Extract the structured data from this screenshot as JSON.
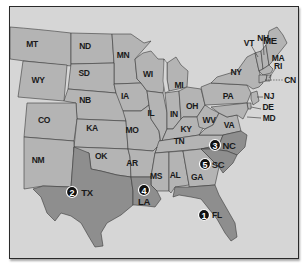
{
  "map": {
    "title": "",
    "background_color": "#d6d6d6",
    "state_fill": "#b4b4b4",
    "highlight_fill": "#8e8e8e",
    "badge_color": "#111111",
    "states": [
      {
        "code": "MT",
        "label": "MT",
        "highlighted": false
      },
      {
        "code": "ND",
        "label": "ND",
        "highlighted": false
      },
      {
        "code": "MN",
        "label": "MN",
        "highlighted": false
      },
      {
        "code": "WY",
        "label": "WY",
        "highlighted": false
      },
      {
        "code": "SD",
        "label": "SD",
        "highlighted": false
      },
      {
        "code": "WI",
        "label": "WI",
        "highlighted": false
      },
      {
        "code": "MI",
        "label": "MI",
        "highlighted": false
      },
      {
        "code": "NB",
        "label": "NB",
        "highlighted": false
      },
      {
        "code": "IA",
        "label": "IA",
        "highlighted": false
      },
      {
        "code": "CO",
        "label": "CO",
        "highlighted": false
      },
      {
        "code": "KA",
        "label": "KA",
        "highlighted": false
      },
      {
        "code": "MO",
        "label": "MO",
        "highlighted": false
      },
      {
        "code": "IL",
        "label": "IL",
        "highlighted": false
      },
      {
        "code": "IN",
        "label": "IN",
        "highlighted": false
      },
      {
        "code": "OH",
        "label": "OH",
        "highlighted": false
      },
      {
        "code": "KY",
        "label": "KY",
        "highlighted": false
      },
      {
        "code": "WV",
        "label": "WV",
        "highlighted": false
      },
      {
        "code": "VA",
        "label": "VA",
        "highlighted": false
      },
      {
        "code": "PA",
        "label": "PA",
        "highlighted": false
      },
      {
        "code": "NY",
        "label": "NY",
        "highlighted": false
      },
      {
        "code": "VT",
        "label": "VT",
        "highlighted": false
      },
      {
        "code": "NH",
        "label": "NH",
        "highlighted": false
      },
      {
        "code": "ME",
        "label": "ME",
        "highlighted": false
      },
      {
        "code": "MA",
        "label": "MA",
        "highlighted": false
      },
      {
        "code": "RI",
        "label": "RI",
        "highlighted": false
      },
      {
        "code": "CN",
        "label": "CN",
        "highlighted": false
      },
      {
        "code": "NJ",
        "label": "NJ",
        "highlighted": false
      },
      {
        "code": "DE",
        "label": "DE",
        "highlighted": false
      },
      {
        "code": "MD",
        "label": "MD",
        "highlighted": false
      },
      {
        "code": "NM",
        "label": "NM",
        "highlighted": false
      },
      {
        "code": "OK",
        "label": "OK",
        "highlighted": false
      },
      {
        "code": "AR",
        "label": "AR",
        "highlighted": false
      },
      {
        "code": "TN",
        "label": "TN",
        "highlighted": false
      },
      {
        "code": "MS",
        "label": "MS",
        "highlighted": false
      },
      {
        "code": "AL",
        "label": "AL",
        "highlighted": false
      },
      {
        "code": "GA",
        "label": "GA",
        "highlighted": false
      },
      {
        "code": "TX",
        "label": "TX",
        "highlighted": true,
        "rank": "2"
      },
      {
        "code": "LA",
        "label": "LA",
        "highlighted": true,
        "rank": "4"
      },
      {
        "code": "NC",
        "label": "NC",
        "highlighted": true,
        "rank": "3"
      },
      {
        "code": "SC",
        "label": "SC",
        "highlighted": true,
        "rank": "5"
      },
      {
        "code": "FL",
        "label": "FL",
        "highlighted": true,
        "rank": "1"
      }
    ],
    "ranked": [
      {
        "rank": "1",
        "state": "FL"
      },
      {
        "rank": "2",
        "state": "TX"
      },
      {
        "rank": "3",
        "state": "NC"
      },
      {
        "rank": "4",
        "state": "LA"
      },
      {
        "rank": "5",
        "state": "SC"
      }
    ]
  }
}
